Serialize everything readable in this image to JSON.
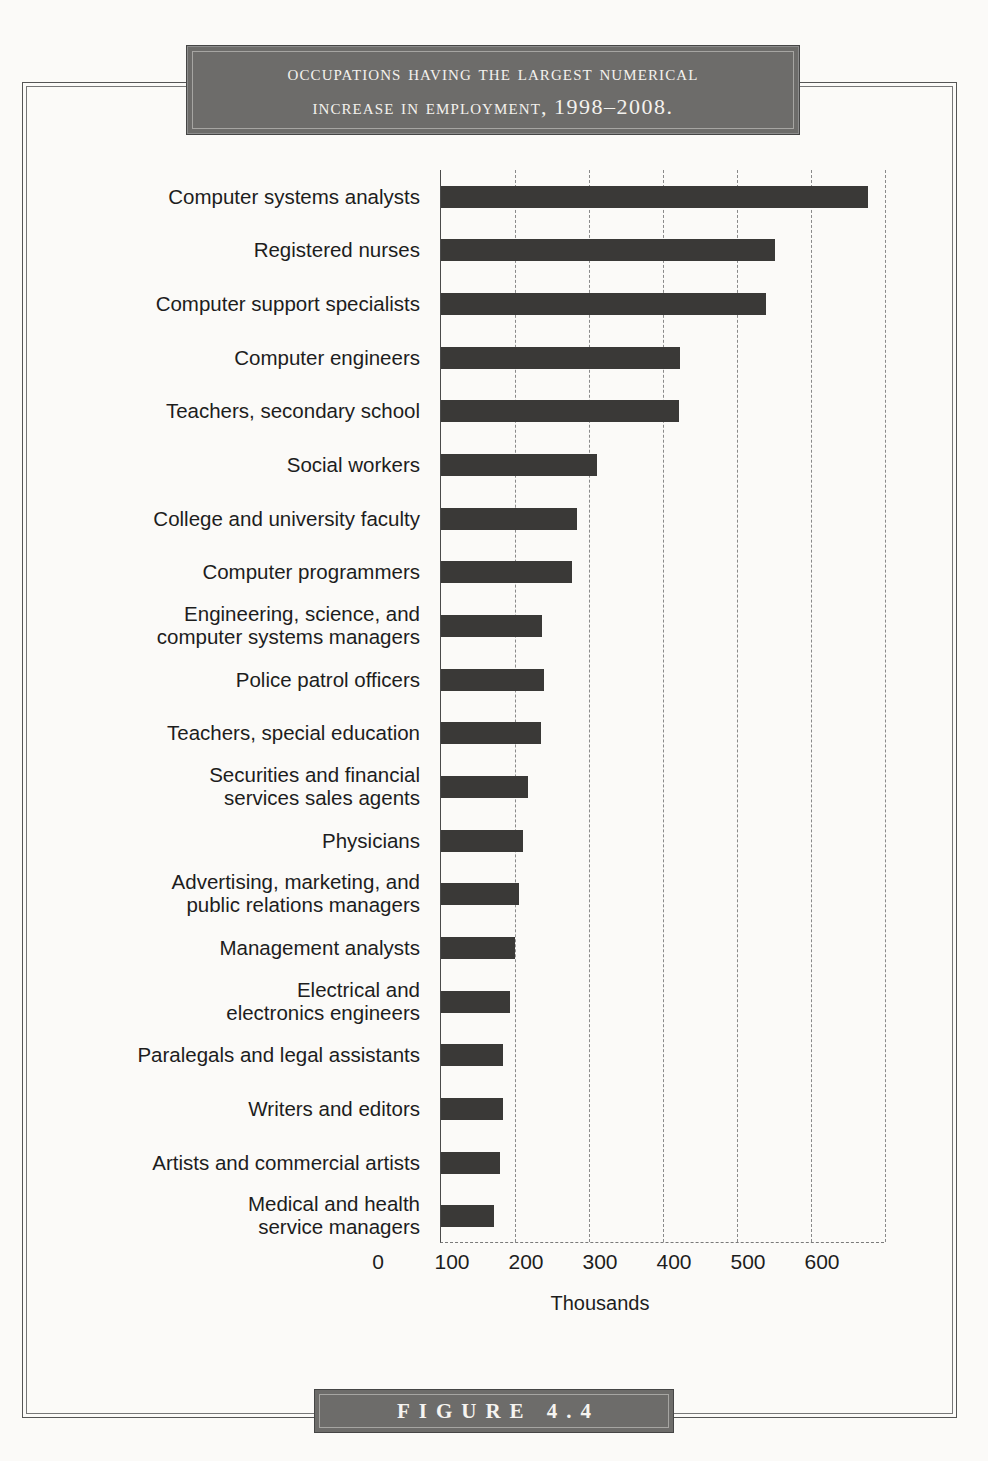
{
  "figure": {
    "title_line1": "Occupations having the largest numerical",
    "title_line2_prefix": "increase in employment, ",
    "title_line2_years": "1998–2008.",
    "caption": "FIGURE 4.4"
  },
  "colors": {
    "banner_fill": "#6d6c6a",
    "banner_text": "#f4f2ee",
    "bar_fill": "#3a3937",
    "axis": "#4a4a4a",
    "grid": "#8a8a8a",
    "page_bg": "#fbfaf8"
  },
  "chart_data": {
    "type": "bar",
    "orientation": "horizontal",
    "title": "Occupations having the largest numerical increase in employment, 1998–2008.",
    "xlabel": "Thousands",
    "ylabel": "",
    "xlim": [
      0,
      600
    ],
    "xticks": [
      0,
      100,
      200,
      300,
      400,
      500,
      600
    ],
    "xtick_labels": [
      "0",
      "100",
      "200",
      "300",
      "400",
      "500",
      "600"
    ],
    "grid": "vertical dashed gridlines at each 100",
    "legend": "none",
    "categories": [
      "Computer systems analysts",
      "Registered nurses",
      "Computer support specialists",
      "Computer engineers",
      "Teachers, secondary school",
      "Social workers",
      "College and university faculty",
      "Computer programmers",
      "Engineering, science, and computer systems managers",
      "Police patrol officers",
      "Teachers, special education",
      "Securities and financial services sales agents",
      "Physicians",
      "Advertising, marketing, and public relations managers",
      "Management analysts",
      "Electrical and electronics engineers",
      "Paralegals and legal assistants",
      "Writers and editors",
      "Artists and commercial artists",
      "Medical and health service managers"
    ],
    "category_lines": [
      [
        "Computer systems analysts"
      ],
      [
        "Registered nurses"
      ],
      [
        "Computer support specialists"
      ],
      [
        "Computer engineers"
      ],
      [
        "Teachers, secondary school"
      ],
      [
        "Social workers"
      ],
      [
        "College and university faculty"
      ],
      [
        "Computer programmers"
      ],
      [
        "Engineering, science, and",
        "computer systems managers"
      ],
      [
        "Police patrol officers"
      ],
      [
        "Teachers, special education"
      ],
      [
        "Securities and financial",
        "services sales agents"
      ],
      [
        "Physicians"
      ],
      [
        "Advertising, marketing, and",
        "public relations managers"
      ],
      [
        "Management analysts"
      ],
      [
        "Electrical and",
        "electronics engineers"
      ],
      [
        "Paralegals and legal assistants"
      ],
      [
        "Writers and editors"
      ],
      [
        "Artists and commercial artists"
      ],
      [
        "Medical and health",
        "service managers"
      ]
    ],
    "values": [
      577,
      451,
      439,
      323,
      322,
      211,
      184,
      177,
      136,
      139,
      135,
      118,
      111,
      105,
      100,
      93,
      84,
      84,
      80,
      72
    ],
    "units": "thousands of jobs"
  }
}
